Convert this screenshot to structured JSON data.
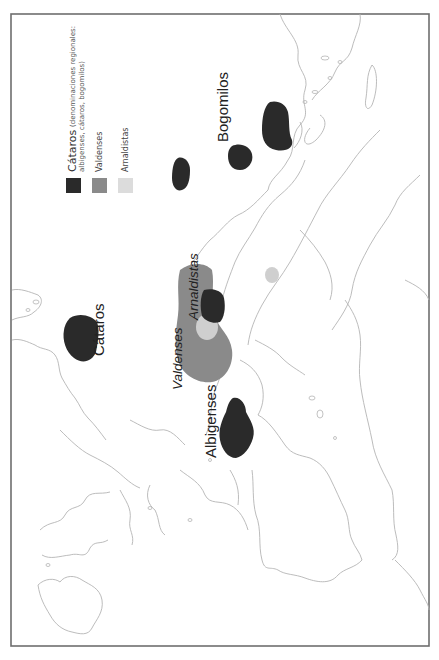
{
  "map": {
    "orientation": "rotated-90-ccw",
    "labels": {
      "cataros": "Cátaros",
      "bogomilos": "Bogomilos",
      "albigenses": "Albigenses",
      "valdenses": "Valdenses",
      "arnaldistas": "Arnaldistas"
    },
    "legend": {
      "items": [
        {
          "label": "Cátaros",
          "note_line1": "(denominaciones regionales:",
          "note_line2": "albigenses, cátaros, bogomilos)",
          "color": "#2a2a2a"
        },
        {
          "label": "Valdenses",
          "color": "#8a8a8a"
        },
        {
          "label": "Arnaldistas",
          "color": "#dcdcdc"
        }
      ]
    },
    "colors": {
      "cataros": "#2a2a2a",
      "valdenses": "#8a8a8a",
      "arnaldistas": "#cfcfcf",
      "coastline": "#b4b4b4",
      "frame": "#6e6e6e"
    }
  }
}
